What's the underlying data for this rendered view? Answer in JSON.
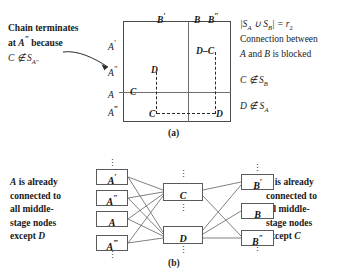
{
  "figure": {
    "panel_a": {
      "caption": "(a)",
      "annotation_left": {
        "line1": "Chain terminates",
        "line2_pre": "at ",
        "line2_var": "A",
        "line2_prime": "″",
        "line2_post": " because",
        "line3_pre": "C ∉ S",
        "line3_sub": "A″"
      },
      "top_labels": [
        {
          "base": "B",
          "prime": "′"
        },
        {
          "base": "B",
          "prime": ""
        },
        {
          "base": "B",
          "prime": "″"
        }
      ],
      "left_labels": [
        {
          "base": "A",
          "prime": "′"
        },
        {
          "base": "A",
          "prime": "″"
        },
        {
          "base": "A",
          "prime": ""
        },
        {
          "base": "A",
          "prime": "‴"
        }
      ],
      "inner_marks": {
        "top_right_pair_left": "D",
        "top_right_pair_dash": "–",
        "top_right_pair_right": "C",
        "mid_left_D": "D",
        "row_A_C": "C",
        "bottom_left_C": "C",
        "bottom_right_D": "D"
      },
      "annotation_right": {
        "line1_pre": "|S",
        "line1_subA": "A",
        "line1_union": " ∪ S",
        "line1_subB": "B",
        "line1_post": "| = r",
        "line1_sub2": "2",
        "line2": "Connection between",
        "line3_pre": "A",
        "line3_mid": " and ",
        "line3_var2": "B",
        "line3_post": " is blocked",
        "line4_pre": "C ∉ S",
        "line4_sub": "B",
        "line5_pre": "D ∉ S",
        "line5_sub": "A"
      }
    },
    "panel_b": {
      "caption": "(b)",
      "left_text": {
        "line1_var": "A",
        "line1_rest": " is already",
        "line2": "connected to",
        "line3": "all middle-",
        "line4": "stage nodes",
        "line5_pre": "except ",
        "line5_var": "D"
      },
      "right_text": {
        "line1_var": "B",
        "line1_rest": " is already",
        "line2": "connected to",
        "line3": "all middle-",
        "line4": "stage nodes",
        "line5_pre": "except ",
        "line5_var": "C"
      },
      "left_nodes": [
        {
          "base": "A",
          "prime": "′"
        },
        {
          "base": "A",
          "prime": "″"
        },
        {
          "base": "A",
          "prime": ""
        },
        {
          "base": "A",
          "prime": "‴"
        }
      ],
      "middle_nodes": [
        {
          "base": "C",
          "prime": ""
        },
        {
          "base": "D",
          "prime": ""
        }
      ],
      "right_nodes": [
        {
          "base": "B",
          "prime": "′"
        },
        {
          "base": "B",
          "prime": ""
        },
        {
          "base": "B",
          "prime": "″"
        }
      ],
      "dots_glyph": "⋮"
    }
  },
  "colors": {
    "ink": "#1a1a1a",
    "rule": "#6e6e6e",
    "box_border": "#4a4a4a",
    "background": "#ffffff"
  }
}
